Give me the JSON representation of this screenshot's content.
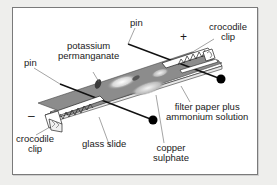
{
  "diagram": {
    "labels": {
      "pin_left": "pin",
      "pin_right": "pin",
      "potassium_permanganate_line1": "potassium",
      "potassium_permanganate_line2": "permanganate",
      "crocodile_clip_right_line1": "crocodile",
      "crocodile_clip_right_line2": "clip",
      "crocodile_clip_left_line1": "crocodile",
      "crocodile_clip_left_line2": "clip",
      "glass_slide": "glass slide",
      "copper_sulphate_line1": "copper",
      "copper_sulphate_line2": "sulphate",
      "filter_paper_line1": "filter paper plus",
      "filter_paper_line2": "ammonium solution"
    },
    "terminals": {
      "positive": "+",
      "negative": "–"
    },
    "colors": {
      "background": "#eeeeec",
      "panel": "#ffffff",
      "filter_paper": "#8e8e8e",
      "ink": "#1a1a1a"
    }
  }
}
